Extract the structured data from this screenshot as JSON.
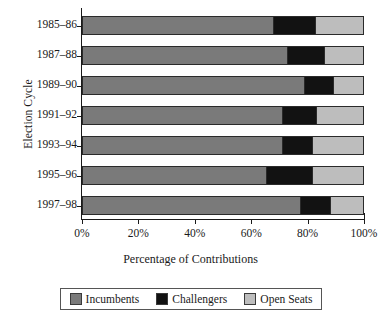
{
  "chart_data": {
    "type": "bar",
    "orientation": "horizontal",
    "stacked": true,
    "stacked_percent": true,
    "title": "",
    "xlabel": "Percentage of Contributions",
    "ylabel": "Election Cycle",
    "xlim": [
      0,
      100
    ],
    "xticks": [
      0,
      20,
      40,
      60,
      80,
      100
    ],
    "xtick_labels": [
      "0%",
      "20%",
      "40%",
      "60%",
      "80%",
      "100%"
    ],
    "grid": false,
    "legend_position": "bottom",
    "categories": [
      "1985–86",
      "1987–88",
      "1989–90",
      "1991–92",
      "1993–94",
      "1995–96",
      "1997–98"
    ],
    "series": [
      {
        "name": "Incumbents",
        "color": "#7a7a7a",
        "values": [
          68.5,
          73.5,
          79.5,
          71.5,
          71.5,
          66.0,
          78.0
        ]
      },
      {
        "name": "Challengers",
        "color": "#121212",
        "values": [
          14.5,
          13.0,
          10.0,
          12.0,
          10.5,
          16.0,
          10.5
        ]
      },
      {
        "name": "Open Seats",
        "color": "#bdbdbd",
        "values": [
          17.0,
          13.5,
          10.5,
          16.5,
          18.0,
          18.0,
          11.5
        ]
      }
    ]
  }
}
